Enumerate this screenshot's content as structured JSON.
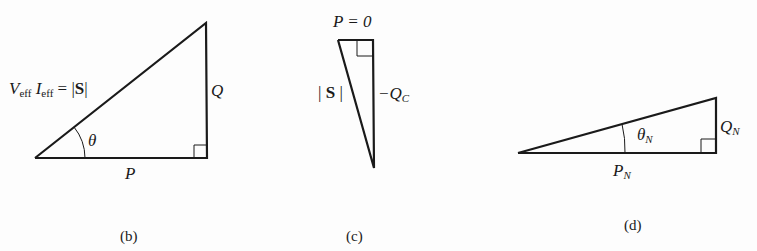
{
  "figure": {
    "panels": [
      {
        "id": "b",
        "caption": "(b)",
        "hypotenuse_label": {
          "V": "V",
          "V_sub": "eff",
          "I": "I",
          "I_sub": "eff",
          "rest": " = |",
          "S": "S",
          "end": "|"
        },
        "vertical_label": "Q",
        "horizontal_label": "P",
        "angle_label": "θ"
      },
      {
        "id": "c",
        "caption": "(c)",
        "top_label": "P = 0",
        "hypotenuse_label": {
          "open": "| ",
          "S": "S",
          "close": " |"
        },
        "vertical_label": {
          "prefix": "−Q",
          "sub": "C"
        }
      },
      {
        "id": "d",
        "caption": "(d)",
        "angle_label": {
          "main": "θ",
          "sub": "N"
        },
        "vertical_label": {
          "main": "Q",
          "sub": "N"
        },
        "horizontal_label": {
          "main": "P",
          "sub": "N"
        }
      }
    ],
    "colors": {
      "line": "#1a1a1a",
      "background": "#fdfdfd"
    }
  }
}
